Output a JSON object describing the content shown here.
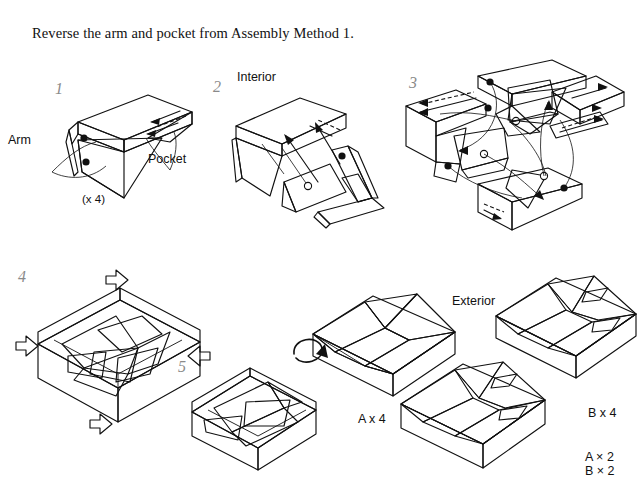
{
  "document": {
    "title_text": "Reverse the arm and pocket from Assembly Method 1."
  },
  "steps": [
    {
      "id": "step-1",
      "number": "1"
    },
    {
      "id": "step-2",
      "number": "2"
    },
    {
      "id": "step-3",
      "number": "3"
    },
    {
      "id": "step-4",
      "number": "4"
    },
    {
      "id": "step-5",
      "number": "5"
    }
  ],
  "labels": {
    "arm": "Arm",
    "pocket": "Pocket",
    "times_four": "(x 4)",
    "interior": "Interior",
    "exterior": "Exterior",
    "a_times_4": "A x 4",
    "b_times_4": "B x 4",
    "a_times_2": "A × 2",
    "b_times_2": "B × 2"
  },
  "colors": {
    "ink": "#111111",
    "paper": "#ffffff",
    "face_light": "#efefef",
    "face_mid": "#c9c9c9",
    "face_dark": "#a9a9a9",
    "face_shadow": "#8f8f8f",
    "stepnum": "#8a8a8a"
  },
  "icons": {
    "push_arrow": "push-arrow-icon",
    "rotate_arrow": "rotate-arrow-icon",
    "motion_arrow": "motion-arrow-icon",
    "dot_filled": "filled-dot-marker",
    "dot_open": "open-dot-marker"
  }
}
